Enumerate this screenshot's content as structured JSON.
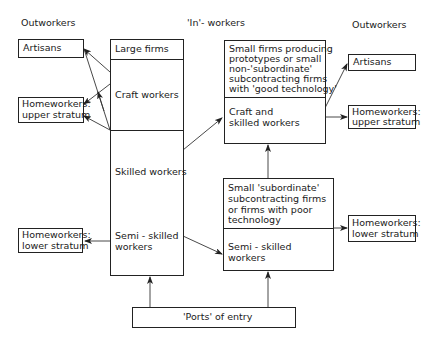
{
  "headers": {
    "left": "Outworkers",
    "center": "'In'- workers",
    "right": "Outworkers"
  },
  "left_outworkers": {
    "artisans": "Artisans",
    "homeworkers_upper": [
      "Homeworkers:",
      "upper stratum"
    ],
    "homeworkers_lower": [
      "Homeworkers:",
      "lower stratum"
    ]
  },
  "large_firms_column": {
    "title": "Large firms",
    "craft": "Craft workers",
    "skilled": "Skilled workers",
    "semi_skilled": [
      "Semi - skilled",
      "workers"
    ]
  },
  "small_firms_good": {
    "title": [
      "Small firms producing",
      "prototypes or small",
      "non-'subordinate'",
      "subcontracting firms",
      "with 'good technology'"
    ],
    "workers": [
      "Craft and",
      "skilled workers"
    ]
  },
  "small_firms_poor": {
    "title": [
      "Small 'subordinate'",
      "subcontracting firms",
      "or firms with poor",
      "technology"
    ],
    "workers": [
      "Semi - skilled",
      "workers"
    ]
  },
  "right_outworkers": {
    "artisans": "Artisans",
    "homeworkers_upper": [
      "Homeworkers:",
      "upper stratum"
    ],
    "homeworkers_lower": [
      "Homeworkers:",
      "lower stratum"
    ]
  },
  "entry": {
    "label": "'Ports' of entry"
  },
  "colors": {
    "line": "#222222",
    "background": "#ffffff"
  }
}
